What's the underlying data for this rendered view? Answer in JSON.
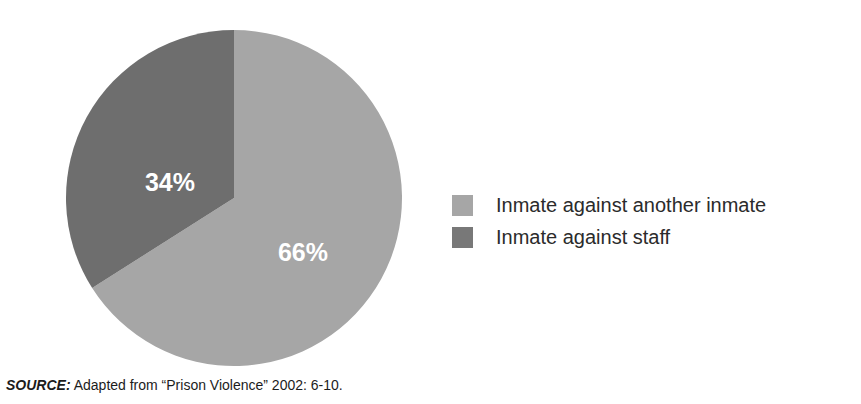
{
  "chart_data": {
    "type": "pie",
    "title": "",
    "subtitle": "",
    "xlabel": "",
    "ylabel": "",
    "categories": [
      "Inmate against another inmate",
      "Inmate against staff"
    ],
    "values": [
      66,
      34
    ],
    "value_unit": "%",
    "data_labels": [
      "66%",
      "34%"
    ],
    "colors": [
      "#a6a6a6",
      "#6e6e6e"
    ],
    "start_angle_deg": 0,
    "direction": "clockwise",
    "legend_position": "right",
    "grid": false,
    "slices": [
      {
        "label": "Inmate against another inmate",
        "value": 66,
        "data_label": "66%",
        "color": "#a6a6a6",
        "start_deg": 0,
        "end_deg": 237.6
      },
      {
        "label": "Inmate against staff",
        "value": 34,
        "data_label": "34%",
        "color": "#6e6e6e",
        "start_deg": 237.6,
        "end_deg": 360
      }
    ],
    "annotations": []
  },
  "legend": {
    "items": [
      {
        "label": "Inmate against another inmate",
        "color": "#a6a6a6"
      },
      {
        "label": "Inmate against staff",
        "color": "#787878"
      }
    ]
  },
  "source": {
    "kicker": "SOURCE:",
    "text": " Adapted from “Prison Violence” 2002: 6-10."
  }
}
